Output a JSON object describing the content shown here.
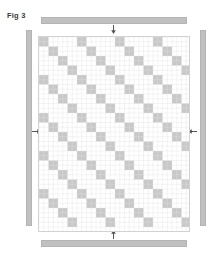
{
  "figure": {
    "label": "Fig 3",
    "title": "Fig 3"
  },
  "colors": {
    "background": "#ffffff",
    "registration_bar": "#c0c0c0",
    "registration_bar_border": "#b4b4b4",
    "pattern_fill": "#c8c8c8",
    "pattern_fill_light": "#d8d8d8",
    "grid_line": "#e2e2e2",
    "panel_border": "#d2d2d2",
    "arrow": "#555555",
    "label_text": "#3a3a3a"
  },
  "registration_bars": [
    {
      "name": "top",
      "orientation": "horizontal",
      "x": 41,
      "y": 17,
      "width": 146,
      "height": 7
    },
    {
      "name": "bottom",
      "orientation": "horizontal",
      "x": 41,
      "y": 240,
      "width": 146,
      "height": 7
    },
    {
      "name": "left",
      "orientation": "vertical",
      "x": 26,
      "y": 30,
      "width": 6,
      "height": 196
    },
    {
      "name": "right",
      "orientation": "vertical",
      "x": 200,
      "y": 30,
      "width": 6,
      "height": 196
    }
  ],
  "arrows": [
    {
      "name": "top",
      "direction": "down",
      "x": 110,
      "y": 25
    },
    {
      "name": "bottom",
      "direction": "up",
      "x": 110,
      "y": 230
    },
    {
      "name": "left",
      "direction": "right",
      "x": 32,
      "y": 128
    },
    {
      "name": "right",
      "direction": "left",
      "x": 188,
      "y": 128
    }
  ],
  "pattern": {
    "name": "recursive-diagonal-quilt",
    "panel": {
      "x": 38,
      "y": 36,
      "width": 152,
      "height": 196
    },
    "unit_size": 19,
    "columns": 8,
    "rows": 10,
    "recursion_depth": 3,
    "description": "Anti-diagonal fractal tiling: each square unit carries a descending diagonal band of filled cells with self-similar sub-blocks along it, repeated across the panel."
  }
}
